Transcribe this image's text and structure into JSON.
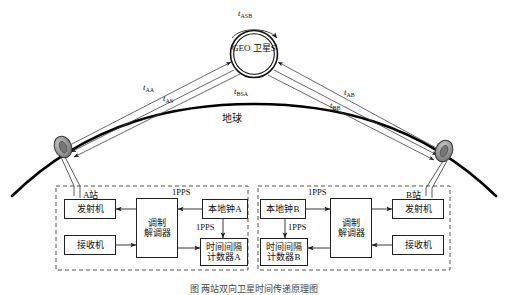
{
  "figure": {
    "caption": "图  两站双向卫星时间传递原理图",
    "earth_label": "地球",
    "satellite": {
      "line1": "GEO",
      "line2": "卫星S"
    }
  },
  "paths": [
    {
      "id": "t_ASB",
      "base": "t",
      "sub": "ASB"
    },
    {
      "id": "t_AA",
      "base": "t",
      "sub": "AA"
    },
    {
      "id": "t_AS",
      "base": "t",
      "sub": "AS"
    },
    {
      "id": "t_BSA",
      "base": "t",
      "sub": "BSA"
    },
    {
      "id": "t_AB",
      "base": "t",
      "sub": "AB"
    },
    {
      "id": "t_BB",
      "base": "t",
      "sub": "BB"
    }
  ],
  "station_a": {
    "name": "A站",
    "boxes": {
      "transmitter": "发射机",
      "receiver": "接收机",
      "modem_line1": "调制",
      "modem_line2": "解调器",
      "clock": "本地钟A",
      "counter_line1": "时间间隔",
      "counter_line2": "计数器A"
    },
    "pps_top": "1PPS",
    "pps_mid": "1PPS"
  },
  "station_b": {
    "name": "B站",
    "boxes": {
      "transmitter": "发射机",
      "receiver": "接收机",
      "modem_line1": "调制",
      "modem_line2": "解调器",
      "clock": "本地钟B",
      "counter_line1": "时间间隔",
      "counter_line2": "计数器B"
    },
    "pps_top": "1PPS",
    "pps_mid": "1PPS"
  },
  "colors": {
    "line": "#222222",
    "earth_arc": "#000000",
    "antenna_fill": "#8d8d8d",
    "box_border": "#222222",
    "dashed_border": "#555555"
  }
}
